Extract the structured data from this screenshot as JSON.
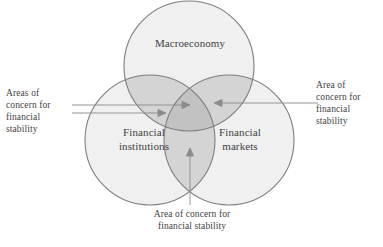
{
  "figure": {
    "name": "financial-stability-venn-diagram",
    "type": "venn-3-circle"
  },
  "circles": {
    "top": {
      "label": "Macroeconomy",
      "name": "macroeconomy"
    },
    "bottom_left": {
      "label": "Financial\ninstitutions",
      "name": "financial-institutions"
    },
    "bottom_right": {
      "label": "Financial\nmarkets",
      "name": "financial-markets"
    }
  },
  "annotations": {
    "left": {
      "text": "Areas of\nconcern for\nfinancial\nstability",
      "name": "areas-of-concern-left"
    },
    "right": {
      "text": "Area of\nconcern for\nfinancial\nstability",
      "name": "area-of-concern-right"
    },
    "bottom": {
      "text": "Area of concern for\nfinancial stability",
      "name": "area-of-concern-bottom"
    }
  },
  "colors": {
    "background": "#ffffff",
    "circle_fill": "#f0f0f0",
    "pair_overlap_fill": "#d4d4d4",
    "triple_overlap_fill": "#c2c2c2",
    "circle_stroke": "#7d7d7d",
    "leader_line": "#8b8b8b",
    "text": "#3f3f3f"
  }
}
